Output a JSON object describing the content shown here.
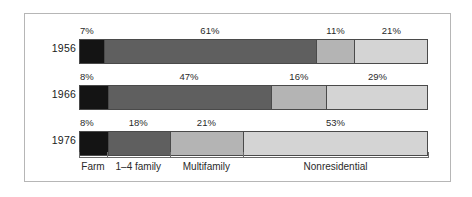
{
  "chart_data": {
    "type": "bar",
    "orientation": "horizontal",
    "stacked": true,
    "normalized": true,
    "title": "",
    "subtitle": "",
    "xlabel": "",
    "ylabel": "",
    "xlim": [
      0,
      100
    ],
    "grid": false,
    "legend_position": "below-axis",
    "categories": [
      "1956",
      "1966",
      "1976"
    ],
    "series": [
      {
        "name": "Farm",
        "color": "#141414",
        "values": [
          7,
          8,
          8
        ]
      },
      {
        "name": "1–4 family",
        "color": "#5f5f5f",
        "values": [
          61,
          47,
          18
        ]
      },
      {
        "name": "Multifamily",
        "color": "#b4b4b4",
        "values": [
          11,
          16,
          21
        ]
      },
      {
        "name": "Nonresidential",
        "color": "#d4d4d4",
        "values": [
          21,
          29,
          53
        ]
      }
    ],
    "axis_tick_labels": [
      "Farm",
      "1–4 family",
      "Multifamily",
      "Nonresidential"
    ],
    "data_label_suffix": "%"
  },
  "rows": [
    {
      "label": "1956",
      "segments": [
        {
          "name": "Farm",
          "value": 7,
          "data_label": "7%"
        },
        {
          "name": "1–4 family",
          "value": 61,
          "data_label": "61%"
        },
        {
          "name": "Multifamily",
          "value": 11,
          "data_label": "11%"
        },
        {
          "name": "Nonresidential",
          "value": 21,
          "data_label": "21%"
        }
      ]
    },
    {
      "label": "1966",
      "segments": [
        {
          "name": "Farm",
          "value": 8,
          "data_label": "8%"
        },
        {
          "name": "1–4 family",
          "value": 47,
          "data_label": "47%"
        },
        {
          "name": "Multifamily",
          "value": 16,
          "data_label": "16%"
        },
        {
          "name": "Nonresidential",
          "value": 29,
          "data_label": "29%"
        }
      ]
    },
    {
      "label": "1976",
      "segments": [
        {
          "name": "Farm",
          "value": 8,
          "data_label": "8%"
        },
        {
          "name": "1–4 family",
          "value": 18,
          "data_label": "18%"
        },
        {
          "name": "Multifamily",
          "value": 21,
          "data_label": "21%"
        },
        {
          "name": "Nonresidential",
          "value": 53,
          "data_label": "53%"
        }
      ]
    }
  ],
  "axis": {
    "labels": [
      "Farm",
      "1–4 family",
      "Multifamily",
      "Nonresidential"
    ]
  },
  "colors": {
    "farm": "#141414",
    "one_four_family": "#5f5f5f",
    "multifamily": "#b4b4b4",
    "nonresidential": "#d4d4d4",
    "bar_outline": "#4a4a4a",
    "frame": "#b6b6b6",
    "text": "#2a2a2a",
    "background": "#ffffff"
  }
}
